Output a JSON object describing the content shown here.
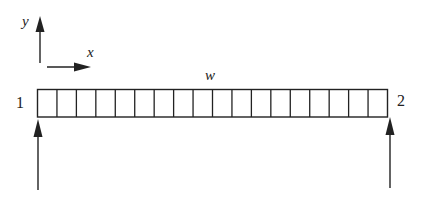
{
  "diagram": {
    "type": "simply-supported-beam-uniform-load",
    "axes": {
      "y_label": "y",
      "x_label": "x"
    },
    "load_label": "w",
    "node_labels": [
      "1",
      "2"
    ],
    "beam": {
      "cell_count": 18
    },
    "supports": [
      {
        "node": "1",
        "type": "upward-reaction-arrow"
      },
      {
        "node": "2",
        "type": "upward-reaction-arrow"
      }
    ],
    "colors": {
      "stroke": "#222222",
      "background": "#ffffff"
    }
  }
}
